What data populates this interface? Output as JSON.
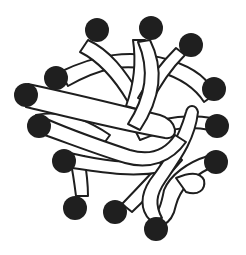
{
  "diagram": {
    "title": "",
    "colors": {
      "background": "#ffffff",
      "outline": "#1e1e1e",
      "end_group": "#1f1f1f",
      "chain_fill": "#ffffff"
    },
    "end_groups": [
      {
        "id": "ball-1",
        "cx": 56,
        "cy": 78,
        "r": 12
      },
      {
        "id": "ball-2",
        "cx": 97,
        "cy": 30,
        "r": 12
      },
      {
        "id": "ball-3",
        "cx": 151,
        "cy": 28,
        "r": 12
      },
      {
        "id": "ball-4",
        "cx": 191,
        "cy": 45,
        "r": 12
      },
      {
        "id": "ball-5",
        "cx": 214,
        "cy": 89,
        "r": 12
      },
      {
        "id": "ball-6",
        "cx": 217,
        "cy": 126,
        "r": 12
      },
      {
        "id": "ball-7",
        "cx": 216,
        "cy": 162,
        "r": 12
      },
      {
        "id": "ball-8",
        "cx": 156,
        "cy": 229,
        "r": 12
      },
      {
        "id": "ball-9",
        "cx": 115,
        "cy": 212,
        "r": 12
      },
      {
        "id": "ball-10",
        "cx": 75,
        "cy": 208,
        "r": 12
      },
      {
        "id": "ball-11",
        "cx": 64,
        "cy": 161,
        "r": 12
      },
      {
        "id": "ball-12",
        "cx": 39,
        "cy": 126,
        "r": 12
      },
      {
        "id": "ball-13",
        "cx": 26,
        "cy": 95,
        "r": 12
      }
    ],
    "labels": []
  }
}
